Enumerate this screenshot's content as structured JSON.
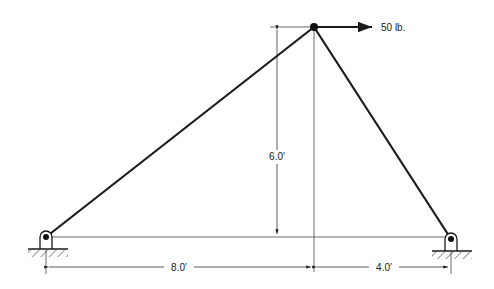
{
  "diagram": {
    "type": "truss-statics",
    "nodes": {
      "left_support": {
        "x": 46,
        "y": 237,
        "support": "pin"
      },
      "apex": {
        "x": 314,
        "y": 27
      },
      "right_support": {
        "x": 451,
        "y": 239,
        "support": "pin"
      }
    },
    "members": [
      {
        "from": "left_support",
        "to": "apex"
      },
      {
        "from": "apex",
        "to": "right_support"
      }
    ],
    "load": {
      "label": "50 lb.",
      "direction": "right",
      "at": "apex"
    },
    "dimensions": {
      "height": "6.0′",
      "left_span": "8.0′",
      "right_span": "4.0′"
    },
    "colors": {
      "line": "#1a1a1a",
      "thin": "#333333"
    }
  }
}
